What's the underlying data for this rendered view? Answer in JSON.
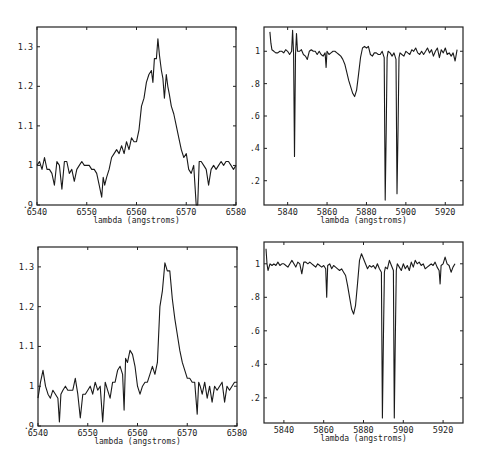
{
  "chart_data": [
    {
      "id": "top-left",
      "type": "line",
      "title": "",
      "xlabel": "lambda (angstroms)",
      "ylabel": "",
      "xlim": [
        6540,
        6580
      ],
      "ylim": [
        0.9,
        1.35
      ],
      "xticks": [
        6540,
        6550,
        6560,
        6570,
        6580
      ],
      "xtick_labels": [
        "6540",
        "6550",
        "6560",
        "6570",
        "6580"
      ],
      "yticks": [
        0.9,
        1.0,
        1.1,
        1.2,
        1.3
      ],
      "ytick_labels": [
        ".9",
        "1",
        "1.1",
        "1.2",
        "1.3"
      ],
      "grid": false,
      "series": [
        {
          "name": "spectrum",
          "x": [
            6540,
            6540.5,
            6541,
            6541.5,
            6542,
            6542.5,
            6543,
            6543.5,
            6544,
            6544.5,
            6545,
            6545.5,
            6546,
            6546.5,
            6547,
            6547.5,
            6548,
            6548.5,
            6549,
            6549.5,
            6550,
            6550.5,
            6551,
            6551.5,
            6552,
            6552.5,
            6553,
            6553.3,
            6553.6,
            6554,
            6554.5,
            6555,
            6555.5,
            6556,
            6556.5,
            6557,
            6557.5,
            6558,
            6558.5,
            6559,
            6559.5,
            6560,
            6560.5,
            6561,
            6561.5,
            6562,
            6562.5,
            6563,
            6563.3,
            6563.6,
            6564,
            6564.3,
            6564.6,
            6565,
            6565.3,
            6565.6,
            6566,
            6566.3,
            6566.6,
            6567,
            6567.5,
            6568,
            6568.5,
            6569,
            6569.5,
            6570,
            6570.5,
            6571,
            6571.5,
            6572,
            6572.3,
            6572.6,
            6573,
            6573.5,
            6574,
            6574.5,
            6575,
            6575.5,
            6576,
            6576.5,
            6577,
            6577.5,
            6578,
            6578.5,
            6579,
            6579.5,
            6580
          ],
          "y": [
            1.0,
            1.01,
            0.99,
            1.02,
            0.99,
            0.99,
            0.98,
            0.95,
            1.01,
            1.0,
            0.94,
            1.01,
            1.01,
            0.98,
            0.99,
            0.96,
            0.99,
            1.0,
            1.01,
            1.0,
            1.0,
            1.0,
            0.99,
            0.99,
            0.98,
            0.95,
            0.92,
            0.97,
            0.95,
            0.97,
            0.99,
            1.02,
            1.03,
            1.04,
            1.03,
            1.05,
            1.03,
            1.06,
            1.04,
            1.07,
            1.06,
            1.06,
            1.09,
            1.15,
            1.17,
            1.21,
            1.23,
            1.24,
            1.21,
            1.27,
            1.27,
            1.32,
            1.28,
            1.24,
            1.22,
            1.17,
            1.23,
            1.2,
            1.18,
            1.15,
            1.13,
            1.1,
            1.07,
            1.04,
            1.02,
            1.03,
            0.99,
            0.98,
            1.0,
            0.88,
            0.88,
            1.01,
            1.01,
            1.0,
            0.99,
            0.95,
            0.99,
            1.0,
            0.99,
            1.0,
            1.01,
            1.0,
            1.01,
            1.01,
            1.0,
            0.99,
            1.0
          ]
        }
      ]
    },
    {
      "id": "top-right",
      "type": "line",
      "title": "",
      "xlabel": "lambda (angstroms)",
      "ylabel": "",
      "xlim": [
        5828,
        5929
      ],
      "ylim": [
        0.05,
        1.15
      ],
      "xticks": [
        5840,
        5860,
        5880,
        5900,
        5920
      ],
      "xtick_labels": [
        "5840",
        "5860",
        "5880",
        "5900",
        "5920"
      ],
      "yticks": [
        0.2,
        0.4,
        0.6,
        0.8,
        1.0
      ],
      "ytick_labels": [
        ".2",
        ".4",
        ".6",
        ".8",
        "1"
      ],
      "grid": false,
      "series": [
        {
          "name": "spectrum",
          "x": [
            5831,
            5831.5,
            5832,
            5833,
            5834,
            5835,
            5836,
            5837,
            5838,
            5839,
            5840,
            5841,
            5842,
            5842.5,
            5843,
            5843.5,
            5844,
            5844.5,
            5845,
            5846,
            5847,
            5848,
            5849,
            5850,
            5851,
            5852,
            5853,
            5854,
            5855,
            5856,
            5857,
            5858,
            5859,
            5859.5,
            5860,
            5861,
            5862,
            5863,
            5864,
            5865,
            5866,
            5867,
            5868,
            5869,
            5870,
            5871,
            5872,
            5873,
            5874,
            5875,
            5876,
            5877,
            5878,
            5879,
            5880,
            5881,
            5882,
            5883,
            5884,
            5885,
            5886,
            5887,
            5888,
            5889,
            5889.5,
            5890,
            5890.5,
            5891,
            5892,
            5893,
            5894,
            5895,
            5895.5,
            5896,
            5896.5,
            5897,
            5898,
            5899,
            5900,
            5901,
            5902,
            5903,
            5904,
            5905,
            5906,
            5907,
            5908,
            5909,
            5910,
            5911,
            5912,
            5913,
            5914,
            5915,
            5916,
            5917,
            5918,
            5919,
            5920,
            5921,
            5922,
            5923,
            5924,
            5925,
            5926
          ],
          "y": [
            1.12,
            1.05,
            1.01,
            1.0,
            0.99,
            0.99,
            1.0,
            1.0,
            0.99,
            1.01,
            1.0,
            0.98,
            1.0,
            1.13,
            0.98,
            0.35,
            0.98,
            1.11,
            1.0,
            1.0,
            1.01,
            0.98,
            0.97,
            0.95,
            1.0,
            1.01,
            1.0,
            1.0,
            0.98,
            1.0,
            0.98,
            0.97,
            0.99,
            0.9,
            1.0,
            0.98,
            0.99,
            1.0,
            1.0,
            0.99,
            0.98,
            0.97,
            0.95,
            0.92,
            0.87,
            0.82,
            0.78,
            0.74,
            0.72,
            0.76,
            0.86,
            0.96,
            1.02,
            1.03,
            1.02,
            1.03,
            0.98,
            0.97,
            0.99,
            0.99,
            0.98,
            0.98,
            1.0,
            0.96,
            0.08,
            0.5,
            0.96,
            1.0,
            0.99,
            0.97,
            0.99,
            0.95,
            0.12,
            0.5,
            0.96,
            0.99,
            0.98,
            0.97,
            1.0,
            0.99,
            0.98,
            1.01,
            1.0,
            1.02,
            0.99,
            0.98,
            1.0,
            0.98,
            1.0,
            1.02,
            0.99,
            1.01,
            0.97,
            1.0,
            1.02,
            0.96,
            1.01,
            0.99,
            1.02,
            0.98,
            0.99,
            0.97,
            0.99,
            0.94,
            1.01
          ]
        }
      ]
    },
    {
      "id": "bottom-left",
      "type": "line",
      "title": "",
      "xlabel": "lambda (angstroms)",
      "ylabel": "",
      "xlim": [
        6540,
        6580
      ],
      "ylim": [
        0.9,
        1.35
      ],
      "xticks": [
        6540,
        6550,
        6560,
        6570,
        6580
      ],
      "xtick_labels": [
        "6540",
        "6550",
        "6560",
        "6570",
        "6580"
      ],
      "yticks": [
        0.9,
        1.0,
        1.1,
        1.2,
        1.3
      ],
      "ytick_labels": [
        ".9",
        "1",
        "1.1",
        "1.2",
        "1.3"
      ],
      "grid": false,
      "series": [
        {
          "name": "spectrum",
          "x": [
            6540,
            6540.5,
            6541,
            6541.5,
            6542,
            6542.5,
            6543,
            6543.5,
            6544,
            6544.3,
            6544.6,
            6545,
            6545.5,
            6546,
            6546.5,
            6547,
            6547.5,
            6548,
            6548.5,
            6549,
            6549.5,
            6550,
            6550.5,
            6551,
            6551.5,
            6552,
            6552.5,
            6553,
            6553.5,
            6554,
            6554.5,
            6555,
            6555.5,
            6556,
            6556.5,
            6557,
            6557.3,
            6557.6,
            6558,
            6558.5,
            6559,
            6559.5,
            6560,
            6560.5,
            6561,
            6561.5,
            6562,
            6562.5,
            6563,
            6563.5,
            6564,
            6564.5,
            6565,
            6565.5,
            6566,
            6566.5,
            6567,
            6567.5,
            6568,
            6568.5,
            6569,
            6569.5,
            6570,
            6570.5,
            6571,
            6571.5,
            6572,
            6572.3,
            6572.6,
            6573,
            6573.5,
            6574,
            6574.5,
            6575,
            6575.5,
            6576,
            6576.5,
            6577,
            6577.5,
            6578,
            6578.5,
            6579,
            6579.5,
            6580
          ],
          "y": [
            0.97,
            1.01,
            1.04,
            1.0,
            0.98,
            0.97,
            0.99,
            0.98,
            0.97,
            0.91,
            0.98,
            0.99,
            1.0,
            0.99,
            0.99,
            0.99,
            1.02,
            0.98,
            0.92,
            0.98,
            0.98,
            0.99,
            1.0,
            0.98,
            1.01,
            0.99,
            1.0,
            0.91,
            1.01,
            0.99,
            0.97,
            1.01,
            1.01,
            1.04,
            1.05,
            1.03,
            0.94,
            1.07,
            1.06,
            1.09,
            1.08,
            1.05,
            1.0,
            0.98,
            1.0,
            1.01,
            1.01,
            1.03,
            1.05,
            1.03,
            1.06,
            1.2,
            1.24,
            1.31,
            1.29,
            1.29,
            1.22,
            1.17,
            1.13,
            1.09,
            1.06,
            1.04,
            1.02,
            1.02,
            1.01,
            1.01,
            0.93,
            1.01,
            1.0,
            0.98,
            1.01,
            0.97,
            1.0,
            0.96,
            1.0,
            0.99,
            1.0,
            1.01,
            0.96,
            1.0,
            0.99,
            1.0,
            1.01,
            1.01
          ]
        }
      ]
    },
    {
      "id": "bottom-right",
      "type": "line",
      "title": "",
      "xlabel": "lambda (angstroms)",
      "ylabel": "",
      "xlim": [
        5830,
        5930
      ],
      "ylim": [
        0.05,
        1.13
      ],
      "xticks": [
        5840,
        5860,
        5880,
        5900,
        5920
      ],
      "xtick_labels": [
        "5840",
        "5860",
        "5880",
        "5900",
        "5920"
      ],
      "yticks": [
        0.2,
        0.4,
        0.6,
        0.8,
        1.0
      ],
      "ytick_labels": [
        ".2",
        ".4",
        ".6",
        ".8",
        "1"
      ],
      "grid": false,
      "series": [
        {
          "name": "spectrum",
          "x": [
            5831,
            5831.5,
            5832,
            5833,
            5834,
            5835,
            5836,
            5837,
            5838,
            5839,
            5840,
            5841,
            5842,
            5843,
            5844,
            5845,
            5846,
            5847,
            5848,
            5849,
            5850,
            5851,
            5852,
            5853,
            5854,
            5855,
            5856,
            5857,
            5858,
            5859,
            5860,
            5861,
            5861.5,
            5862,
            5863,
            5864,
            5865,
            5866,
            5867,
            5868,
            5869,
            5870,
            5871,
            5872,
            5873,
            5874,
            5875,
            5876,
            5877,
            5878,
            5879,
            5880,
            5881,
            5882,
            5883,
            5884,
            5885,
            5886,
            5887,
            5888,
            5889,
            5889.5,
            5890,
            5890.5,
            5891,
            5892,
            5893,
            5894,
            5895,
            5895.5,
            5896,
            5896.5,
            5897,
            5898,
            5899,
            5900,
            5901,
            5902,
            5903,
            5904,
            5905,
            5906,
            5907,
            5908,
            5909,
            5910,
            5911,
            5912,
            5913,
            5914,
            5915,
            5916,
            5917,
            5918,
            5918.5,
            5919,
            5920,
            5921,
            5922,
            5923,
            5924,
            5925,
            5926
          ],
          "y": [
            1.09,
            1.0,
            0.96,
            1.0,
            0.99,
            1.0,
            0.99,
            1.01,
            0.99,
            1.0,
            1.0,
            0.99,
            0.98,
            1.0,
            1.02,
            1.0,
            0.98,
            1.01,
            1.0,
            0.94,
            1.01,
            1.01,
            1.0,
            1.01,
            1.0,
            0.99,
            0.98,
            1.0,
            0.99,
            0.98,
            0.99,
            0.97,
            0.8,
            0.99,
            1.0,
            0.97,
            0.99,
            0.98,
            0.97,
            0.96,
            0.97,
            0.95,
            0.93,
            0.87,
            0.8,
            0.73,
            0.7,
            0.75,
            0.88,
            1.02,
            1.06,
            1.03,
            1.0,
            0.97,
            0.99,
            0.98,
            0.99,
            0.97,
            1.0,
            0.97,
            0.95,
            0.08,
            0.55,
            0.95,
            0.98,
            0.97,
            1.02,
            0.99,
            0.96,
            0.08,
            0.55,
            0.96,
            1.0,
            0.98,
            0.96,
            1.0,
            0.97,
            0.99,
            0.96,
            1.01,
            0.98,
            1.02,
            1.0,
            1.01,
            0.99,
            1.0,
            0.97,
            0.98,
            0.99,
            1.0,
            0.99,
            1.01,
            0.98,
            0.96,
            0.88,
            0.99,
            1.0,
            1.04,
            1.0,
            0.99,
            0.95,
            0.98,
            1.0
          ]
        }
      ]
    }
  ]
}
